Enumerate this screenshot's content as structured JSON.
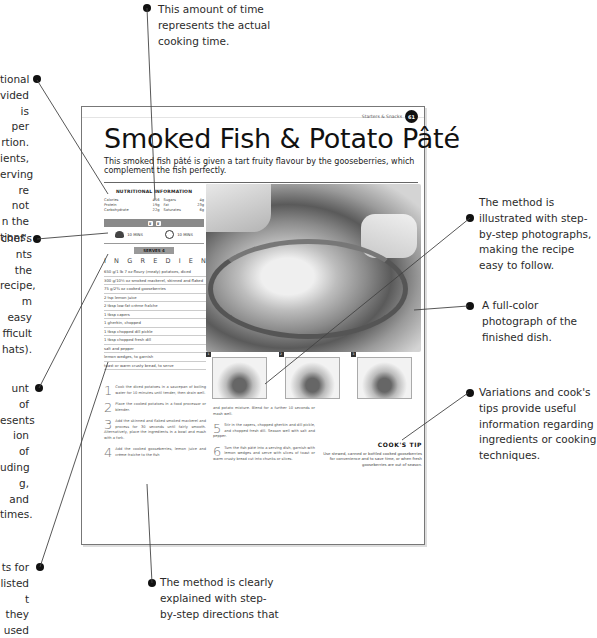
{
  "annotations": {
    "cooking_time": "This amount of time represents the actual cooking time.",
    "nutrition": "tional\nvided\nis per\nrtion.\nients,\nerving\nre not\nn the\ntions.",
    "difficulty": "chef's\nnts the\nrecipe,\nm easy\nfficult\nhats).",
    "prep_time": "unt of\nesents\nion of\nuding\ng, and\ntimes.",
    "ingredients": "ts for\nlisted\nt they\nused",
    "step_photos": "The method is illustrated with step-by-step photographs, making the recipe easy to follow.",
    "full_color_photo": "A full-color photograph of the finished dish.",
    "cooks_tip": "Variations and cook's tips provide useful information regarding ingredients or cooking techniques.",
    "method": "The method is clearly explained with step-by-step directions that"
  },
  "page": {
    "running_head": "Starters & Snacks",
    "page_number": "61",
    "title": "Smoked Fish & Potato Pâté",
    "subtitle": "This smoked fish pâté is given a tart fruity flavour by the gooseberries, which complement the fish perfectly.",
    "nutrition": {
      "heading": "NUTRITIONAL INFORMATION",
      "rows": [
        {
          "l1": "Calories",
          "v1": "416",
          "l2": "Sugars",
          "v2": "4g"
        },
        {
          "l1": "Protein",
          "v1": "19g",
          "l2": "Fat",
          "v2": "23g"
        },
        {
          "l1": "Carbohydrate",
          "v1": "22g",
          "l2": "Saturates",
          "v2": "6g"
        }
      ]
    },
    "difficulty_hats": 2,
    "prep_time": "10 MINS",
    "cook_time": "10 MINS",
    "serves": "SERVES 4",
    "ingredients_heading": "INGREDIENTS",
    "ingredients": [
      "650 g/1 lb 7 oz floury (mealy) potatoes, diced",
      "300 g/10½ oz smoked mackerel, skinned and flaked",
      "75 g/2¾ oz cooked gooseberries",
      "2 tsp lemon juice",
      "2 tbsp low-fat crème fraîche",
      "1 tbsp capers",
      "1 gherkin, chopped",
      "1 tbsp chopped dill pickle",
      "1 tbsp chopped fresh dill",
      "salt and pepper",
      "lemon wedges, to garnish",
      "toast or warm crusty bread, to serve"
    ],
    "steps": [
      {
        "n": "1",
        "text": "Cook the diced potatoes in a saucepan of boiling water for 10 minutes until tender, then drain well."
      },
      {
        "n": "2",
        "text": "Place the cooked potatoes in a food processor or blender."
      },
      {
        "n": "3",
        "text": "Add the skinned and flaked smoked mackerel and process for 30 seconds until fairly smooth. Alternatively, place the ingredients in a bowl and mash with a fork."
      },
      {
        "n": "4",
        "text": "Add the cooked gooseberries, lemon juice and crème fraîche to the fish"
      },
      {
        "n": "",
        "text": "and potato mixture. Blend for a further 10 seconds or mash well."
      },
      {
        "n": "5",
        "text": "Stir in the capers, chopped gherkin and dill pickle, and chopped fresh dill. Season well with salt and pepper."
      },
      {
        "n": "6",
        "text": "Turn the fish pâté into a serving dish, garnish with lemon wedges and serve with slices of toast or warm crusty bread cut into chunks or slices."
      }
    ],
    "step_photo_labels": [
      "1",
      "2",
      "3"
    ],
    "cooks_tip": {
      "heading": "COOK'S TIP",
      "text": "Use stewed, canned or bottled cooked gooseberries for convenience and to save time, or when fresh gooseberries are out of season."
    }
  }
}
